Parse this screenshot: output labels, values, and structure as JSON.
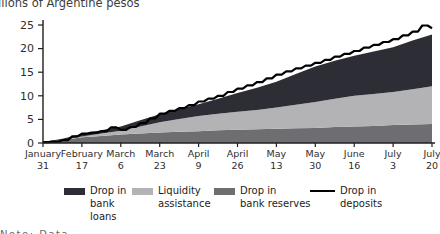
{
  "title": "Billions of Argentine pesos",
  "clipped_footnote": "Note: Data",
  "colors": {
    "loans": "#2d2d35",
    "liquidity": "#b3b3b6",
    "reserves": "#6d6d72",
    "deposits_line": "#000000",
    "axis": "#1f1f1f",
    "tick_label": "#2e2e2e",
    "background": "#ffffff"
  },
  "legend": {
    "items": [
      {
        "name": "loans",
        "swatch": "bar",
        "color": "#2d2d35",
        "label": "Drop in bank loans",
        "lines": [
          "Drop in",
          "bank",
          "loans"
        ]
      },
      {
        "name": "liquidity",
        "swatch": "bar",
        "color": "#b3b3b6",
        "label": "Liquidity assistance",
        "lines": [
          "Liquidity",
          "assistance"
        ]
      },
      {
        "name": "reserves",
        "swatch": "bar",
        "color": "#6d6d72",
        "label": "Drop in bank reserves",
        "lines": [
          "Drop in",
          "bank reserves"
        ]
      },
      {
        "name": "deposits",
        "swatch": "line",
        "color": "#000000",
        "label": "Drop in deposits",
        "lines": [
          "Drop in",
          "deposits"
        ]
      }
    ]
  },
  "chart_data": {
    "type": "area",
    "subtype": "stacked-area-with-line",
    "title": "Billions of Argentine pesos",
    "ylabel": "",
    "xlabel": "",
    "ylim": [
      0,
      25
    ],
    "y_ticks": [
      0,
      5,
      10,
      15,
      20,
      25
    ],
    "grid": false,
    "legend_position": "bottom",
    "x_tick_labels": [
      {
        "month": "January",
        "day": "31"
      },
      {
        "month": "February",
        "day": "17"
      },
      {
        "month": "March",
        "day": "6"
      },
      {
        "month": "March",
        "day": "23"
      },
      {
        "month": "April",
        "day": "9"
      },
      {
        "month": "April",
        "day": "26"
      },
      {
        "month": "May",
        "day": "13"
      },
      {
        "month": "May",
        "day": "30"
      },
      {
        "month": "June",
        "day": "16"
      },
      {
        "month": "July",
        "day": "3"
      },
      {
        "month": "July",
        "day": "20"
      }
    ],
    "stacked": true,
    "series": [
      {
        "name": "Drop in bank reserves",
        "type": "area",
        "color": "#6d6d72",
        "values": [
          0.1,
          0.6,
          1.2,
          1.5,
          1.8,
          2.0,
          2.2,
          2.4,
          2.5,
          2.7,
          2.8,
          2.9,
          3.0,
          3.1,
          3.2,
          3.4,
          3.5,
          3.6,
          3.8,
          3.9,
          4.0
        ]
      },
      {
        "name": "Liquidity assistance",
        "type": "area",
        "color": "#b3b3b6",
        "values": [
          0.0,
          0.1,
          0.2,
          0.5,
          0.8,
          1.5,
          2.2,
          2.7,
          3.2,
          3.5,
          3.8,
          4.1,
          4.5,
          5.0,
          5.5,
          6.0,
          6.5,
          6.8,
          7.0,
          7.5,
          8.0
        ]
      },
      {
        "name": "Drop in bank loans",
        "type": "area",
        "color": "#2d2d35",
        "values": [
          0.1,
          0.2,
          0.5,
          0.7,
          0.9,
          1.3,
          1.7,
          2.1,
          2.5,
          3.2,
          4.0,
          4.7,
          5.5,
          6.5,
          7.5,
          8.0,
          8.5,
          9.0,
          9.5,
          10.3,
          11.0
        ]
      },
      {
        "name": "Drop in deposits",
        "type": "line",
        "color": "#000000",
        "values": [
          0.2,
          0.3,
          0.6,
          1.4,
          2.0,
          2.2,
          2.5,
          3.3,
          2.8,
          3.4,
          4.2,
          5.2,
          6.2,
          6.8,
          7.4,
          8.0,
          8.8,
          9.4,
          10.0,
          10.8,
          11.5,
          12.2,
          12.9,
          13.7,
          14.5,
          15.2,
          15.8,
          16.4,
          17.0,
          17.6,
          18.3,
          18.9,
          19.5,
          20.2,
          20.8,
          21.4,
          22.0,
          22.8,
          23.6,
          24.9,
          24.3
        ]
      }
    ]
  }
}
